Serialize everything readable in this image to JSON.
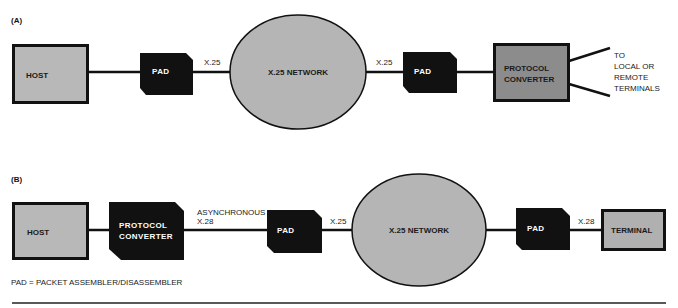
{
  "colors": {
    "background": "#ffffff",
    "ink": "#111111",
    "light_fill": "#b8b8b8",
    "dark_fill": "#8c8c8c",
    "network_fill": "#b5b5b5",
    "pad_fill": "#111111"
  },
  "diagram_a": {
    "panel_label": "(A)",
    "host": {
      "label": "HOST"
    },
    "pad_left": {
      "label": "PAD"
    },
    "link_left": {
      "label": "X.25"
    },
    "network": {
      "label": "X.25 NETWORK"
    },
    "link_right": {
      "label": "X.25"
    },
    "pad_right": {
      "label": "PAD"
    },
    "converter": {
      "line1": "PROTOCOL",
      "line2": "CONVERTER"
    },
    "terminals_note": {
      "line1": "TO",
      "line2": "LOCAL OR",
      "line3": "REMOTE",
      "line4": "TERMINALS"
    }
  },
  "diagram_b": {
    "panel_label": "(B)",
    "host": {
      "label": "HOST"
    },
    "converter": {
      "line1": "PROTOCOL",
      "line2": "CONVERTER"
    },
    "link_async": {
      "line1": "ASYNCHRONOUS",
      "line2": "X.28"
    },
    "pad_left": {
      "label": "PAD"
    },
    "link_x25": {
      "label": "X.25"
    },
    "network": {
      "label": "X.25 NETWORK"
    },
    "pad_right": {
      "label": "PAD"
    },
    "link_x28": {
      "label": "X.28"
    },
    "terminal": {
      "label": "TERMINAL"
    }
  },
  "legend": {
    "text": "PAD = PACKET ASSEMBLER/DISASSEMBLER"
  }
}
